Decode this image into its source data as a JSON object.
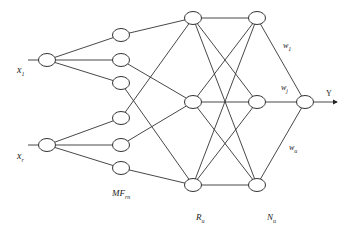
{
  "diagram": {
    "type": "fuzzy neural network",
    "layers": {
      "input": {
        "nodes": [
          {
            "id": "x1",
            "cx": 47,
            "cy": 60,
            "label": "x",
            "sub": "1",
            "label_x": 17,
            "label_y": 73
          },
          {
            "id": "xr",
            "cx": 47,
            "cy": 145,
            "label": "x",
            "sub": "r",
            "label_x": 17,
            "label_y": 159
          }
        ]
      },
      "membership": {
        "label": "MF",
        "sub": "rn",
        "label_x": 112,
        "label_y": 196,
        "nodes": [
          {
            "id": "mf1",
            "cx": 121,
            "cy": 35
          },
          {
            "id": "mf2",
            "cx": 121,
            "cy": 60
          },
          {
            "id": "mf3",
            "cx": 121,
            "cy": 83
          },
          {
            "id": "mf4",
            "cx": 121,
            "cy": 118
          },
          {
            "id": "mf5",
            "cx": 121,
            "cy": 145
          },
          {
            "id": "mf6",
            "cx": 121,
            "cy": 168
          }
        ]
      },
      "rule": {
        "label": "R",
        "sub": "u",
        "label_x": 196,
        "label_y": 220,
        "nodes": [
          {
            "id": "r1",
            "cx": 193,
            "cy": 18
          },
          {
            "id": "r2",
            "cx": 193,
            "cy": 102
          },
          {
            "id": "r3",
            "cx": 193,
            "cy": 185
          }
        ]
      },
      "norm": {
        "label": "N",
        "sub": "u",
        "label_x": 267,
        "label_y": 220,
        "nodes": [
          {
            "id": "n1",
            "cx": 257,
            "cy": 18
          },
          {
            "id": "n2",
            "cx": 257,
            "cy": 102
          },
          {
            "id": "n3",
            "cx": 257,
            "cy": 185
          }
        ]
      },
      "output": {
        "nodes": [
          {
            "id": "y",
            "cx": 305,
            "cy": 102
          }
        ],
        "label": "Y",
        "label_x": 326,
        "label_y": 96
      }
    },
    "weights": [
      {
        "label": "w",
        "sub": "1",
        "x": 283,
        "y": 48
      },
      {
        "label": "w",
        "sub": "j",
        "x": 281,
        "y": 90
      },
      {
        "label": "w",
        "sub": "u",
        "x": 289,
        "y": 150
      }
    ],
    "edges": [
      [
        "x1",
        "mf1"
      ],
      [
        "x1",
        "mf2"
      ],
      [
        "x1",
        "mf3"
      ],
      [
        "xr",
        "mf4"
      ],
      [
        "xr",
        "mf5"
      ],
      [
        "xr",
        "mf6"
      ],
      [
        "mf1",
        "r1"
      ],
      [
        "mf2",
        "r2"
      ],
      [
        "mf3",
        "r3"
      ],
      [
        "mf4",
        "r1"
      ],
      [
        "mf5",
        "r2"
      ],
      [
        "mf6",
        "r3"
      ],
      [
        "r1",
        "n1"
      ],
      [
        "r1",
        "n2"
      ],
      [
        "r1",
        "n3"
      ],
      [
        "r2",
        "n1"
      ],
      [
        "r2",
        "n2"
      ],
      [
        "r2",
        "n3"
      ],
      [
        "r3",
        "n1"
      ],
      [
        "r3",
        "n2"
      ],
      [
        "r3",
        "n3"
      ],
      [
        "n1",
        "y"
      ],
      [
        "n2",
        "y"
      ],
      [
        "n3",
        "y"
      ]
    ],
    "input_stubs": [
      {
        "x1": 28,
        "x2": 39,
        "y": 60
      },
      {
        "x1": 28,
        "x2": 39,
        "y": 145
      }
    ],
    "output_arrow": {
      "x1": 314,
      "x2": 337,
      "y": 102
    },
    "node_rx": 8.5,
    "node_ry": 6.5,
    "stroke_color": "#333333"
  }
}
